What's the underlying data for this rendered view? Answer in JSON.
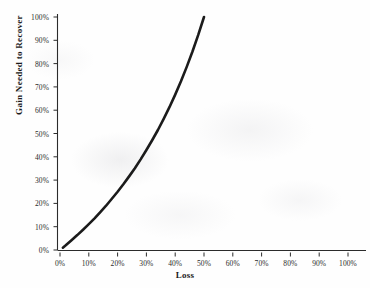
{
  "chart_data": {
    "type": "line",
    "title": "",
    "xlabel": "Loss",
    "ylabel": "Gain Needed to Recover",
    "xlim": [
      0,
      100
    ],
    "ylim": [
      0,
      100
    ],
    "grid": false,
    "legend": "none",
    "x_tick_labels": [
      "0%",
      "10%",
      "20%",
      "30%",
      "40%",
      "50%",
      "60%",
      "70%",
      "80%",
      "90%",
      "100%"
    ],
    "x_tick_values": [
      0,
      10,
      20,
      30,
      40,
      50,
      60,
      70,
      80,
      90,
      100
    ],
    "y_tick_labels": [
      "0%",
      "10%",
      "20%",
      "30%",
      "40%",
      "50%",
      "60%",
      "70%",
      "80%",
      "90%",
      "100%"
    ],
    "y_tick_values": [
      0,
      10,
      20,
      30,
      40,
      50,
      60,
      70,
      80,
      90,
      100
    ],
    "series": [
      {
        "name": "Gain Needed to Recover",
        "color": "#1b1b1b",
        "x": [
          1,
          2,
          4,
          6,
          8,
          10,
          12,
          14,
          16,
          18,
          20,
          22,
          24,
          26,
          28,
          30,
          32,
          34,
          36,
          38,
          40,
          42,
          44,
          46,
          48,
          50
        ],
        "values": [
          1.0,
          2.0,
          4.2,
          6.4,
          8.7,
          11.1,
          13.6,
          16.3,
          19.0,
          22.0,
          25.0,
          28.2,
          31.6,
          35.1,
          38.9,
          42.9,
          47.1,
          51.5,
          56.3,
          61.3,
          66.7,
          72.4,
          78.6,
          85.2,
          92.3,
          100.0
        ]
      }
    ],
    "curve_start": {
      "x": 1,
      "y": 1
    },
    "curve_end": {
      "x": 50,
      "y": 100
    },
    "formula_note": "gain = loss / (1 - loss)"
  },
  "axis_titles": {
    "x": "Loss",
    "y": "Gain Needed to Recover"
  },
  "colors": {
    "curve": "#1b1b1b",
    "axis": "#2b2b2b",
    "background": "#fefefe",
    "text": "#1a1a1a"
  }
}
